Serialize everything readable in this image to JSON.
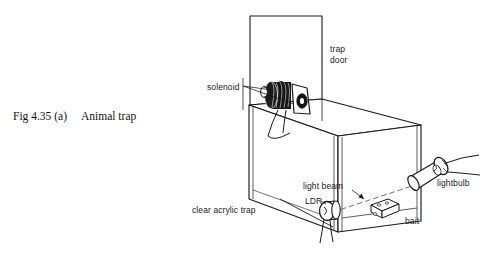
{
  "figure": {
    "caption_number": "Fig 4.35 (a)",
    "caption_title": "Animal trap",
    "labels": {
      "trap_door_line1": "trap",
      "trap_door_line2": "door",
      "solenoid": "solenoid",
      "lightbulb": "lightbulb",
      "light_beam": "light beam",
      "ldr": "LDR",
      "bait": "bait",
      "clear_acrylic_trap": "clear acrylic trap"
    },
    "colors": {
      "ink": "#1a1a1a",
      "background": "#ffffff",
      "coil_fill": "#111111",
      "beam": "#555555"
    }
  }
}
